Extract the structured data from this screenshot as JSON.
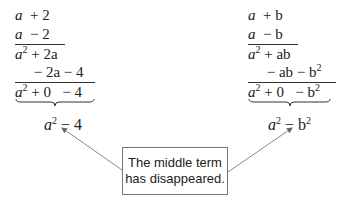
{
  "left": {
    "rows": [
      {
        "a": "a",
        "rest": "  + 2"
      },
      {
        "a": "a",
        "rest": "  − 2"
      },
      {
        "a": "a",
        "sup": "2",
        "rest": " + 2a"
      },
      {
        "a": "",
        "rest": "     − 2a − 4"
      },
      {
        "a": "a",
        "sup": "2",
        "rest": " + 0   − 4"
      }
    ],
    "result": {
      "a": "a",
      "sup": "2",
      "rest": " − 4"
    }
  },
  "right": {
    "rows": [
      {
        "a": "a",
        "rest": "  + b"
      },
      {
        "a": "a",
        "rest": "  − b"
      },
      {
        "a": "a",
        "sup": "2",
        "rest": " + ab"
      },
      {
        "a": "",
        "rest": "     − ab − b",
        "sup2": "2"
      },
      {
        "a": "a",
        "sup": "2",
        "rest": " + 0   − b",
        "sup2": "2"
      }
    ],
    "result": {
      "a": "a",
      "sup": "2",
      "rest": " − b",
      "sup2": "2"
    }
  },
  "note": {
    "line1": "The middle term",
    "line2": "has disappeared."
  }
}
